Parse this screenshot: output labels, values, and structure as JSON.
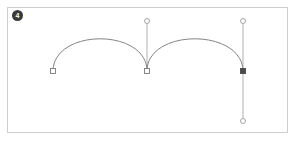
{
  "canvas": {
    "background_color": "#ffffff",
    "border_color": "#d2d2d2",
    "x": 7,
    "y": 7,
    "width": 281,
    "height": 126
  },
  "step_badge": {
    "label": "4",
    "background_color": "#3a3a3a",
    "text_color": "#ffffff"
  },
  "path": {
    "stroke_color": "#858585",
    "stroke_width": 1,
    "fill": "none",
    "d": "M 53 71 C 53 28 147 28 147 71 C 147 28 243 28 243 71",
    "segments": [
      {
        "name": "arc-left",
        "from": [
          53,
          71
        ],
        "control1": [
          53,
          28
        ],
        "control2": [
          147,
          28
        ],
        "to": [
          147,
          71
        ]
      },
      {
        "name": "arc-right",
        "from": [
          147,
          71
        ],
        "control1": [
          147,
          28
        ],
        "control2": [
          243,
          28
        ],
        "to": [
          243,
          71
        ]
      }
    ]
  },
  "anchors": [
    {
      "name": "anchor-start",
      "x": 53,
      "y": 71,
      "selected": false,
      "fill": "#ffffff",
      "stroke": "#7a7a7a",
      "size": 5
    },
    {
      "name": "anchor-middle",
      "x": 147,
      "y": 71,
      "selected": false,
      "fill": "#ffffff",
      "stroke": "#7a7a7a",
      "size": 5
    },
    {
      "name": "anchor-end",
      "x": 243,
      "y": 71,
      "selected": true,
      "fill": "#4a4a4a",
      "stroke": "#4a4a4a",
      "size": 5
    }
  ],
  "handles": [
    {
      "name": "handle-middle-up",
      "anchor": [
        147,
        71
      ],
      "point": [
        147,
        21
      ],
      "line_color": "#a8a8a8",
      "knob_fill": "#ffffff",
      "knob_stroke": "#9a9a9a",
      "knob_radius": 2.5
    },
    {
      "name": "handle-end-up",
      "anchor": [
        243,
        71
      ],
      "point": [
        243,
        21
      ],
      "line_color": "#a8a8a8",
      "knob_fill": "#ffffff",
      "knob_stroke": "#9a9a9a",
      "knob_radius": 2.5
    },
    {
      "name": "handle-end-down",
      "anchor": [
        243,
        71
      ],
      "point": [
        243,
        121
      ],
      "line_color": "#a8a8a8",
      "knob_fill": "#ffffff",
      "knob_stroke": "#9a9a9a",
      "knob_radius": 2.5
    }
  ]
}
